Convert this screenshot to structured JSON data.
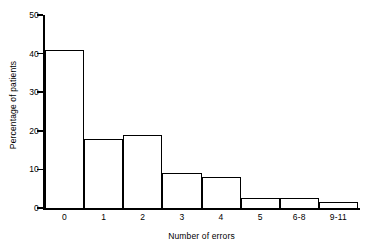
{
  "chart_data": {
    "type": "bar",
    "title": "",
    "subtitle": "",
    "xlabel": "Number of errors",
    "ylabel": "Percentage of patients",
    "categories": [
      "0",
      "1",
      "2",
      "3",
      "4",
      "5",
      "6-8",
      "9-11"
    ],
    "values": [
      41,
      18,
      19,
      9,
      8,
      2.5,
      2.5,
      1.5
    ],
    "ylim": [
      0,
      50
    ],
    "yticks": [
      0,
      10,
      20,
      30,
      40,
      50
    ],
    "ytick_labels": [
      "0",
      "10",
      "20",
      "30",
      "40",
      "50"
    ],
    "grid": false,
    "legend": "none",
    "bar_fill_color": "#ffffff",
    "bar_edge_color": "#000000",
    "axis_color": "#000000",
    "background_color": "#ffffff",
    "style": "histogram, adjacent bars, no gaps"
  }
}
